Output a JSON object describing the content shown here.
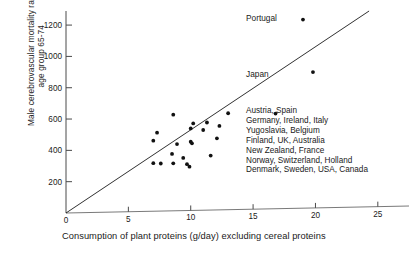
{
  "chart_data": {
    "type": "scatter",
    "title": "",
    "xlabel": "Consumption of plant proteins (g/day) excluding cereal proteins",
    "ylabel_lines": [
      "Male cerebrovascular mortality rates,",
      "age group 65-74"
    ],
    "xlim": [
      0,
      27.5
    ],
    "ylim": [
      0,
      1290
    ],
    "xticks": [
      0,
      5,
      10,
      15,
      20,
      25
    ],
    "yticks": [
      200,
      400,
      600,
      800,
      1000,
      1200
    ],
    "grid": false,
    "legend": "none",
    "points": [
      {
        "x": 19.0,
        "y": 1235
      },
      {
        "x": 19.8,
        "y": 900
      },
      {
        "x": 16.8,
        "y": 635
      },
      {
        "x": 13.0,
        "y": 637
      },
      {
        "x": 8.6,
        "y": 628
      },
      {
        "x": 11.3,
        "y": 578
      },
      {
        "x": 10.2,
        "y": 572
      },
      {
        "x": 12.3,
        "y": 556
      },
      {
        "x": 10.0,
        "y": 540
      },
      {
        "x": 11.0,
        "y": 530
      },
      {
        "x": 7.3,
        "y": 513
      },
      {
        "x": 12.1,
        "y": 477
      },
      {
        "x": 7.0,
        "y": 462
      },
      {
        "x": 10.0,
        "y": 455
      },
      {
        "x": 10.1,
        "y": 445
      },
      {
        "x": 8.9,
        "y": 440
      },
      {
        "x": 8.5,
        "y": 377
      },
      {
        "x": 11.6,
        "y": 367
      },
      {
        "x": 9.4,
        "y": 352
      },
      {
        "x": 7.0,
        "y": 318
      },
      {
        "x": 7.6,
        "y": 316
      },
      {
        "x": 8.6,
        "y": 317
      },
      {
        "x": 9.7,
        "y": 312
      },
      {
        "x": 9.9,
        "y": 296
      }
    ],
    "trendline": {
      "x0": 0,
      "y0": 0,
      "x1": 24.3,
      "y1": 1290
    },
    "annotations": [
      {
        "name": "portugal",
        "text": "Portugal"
      },
      {
        "name": "japan",
        "text": "Japan"
      }
    ],
    "country_list": [
      "Austria, Spain",
      "Germany, Ireland, Italy",
      "Yugoslavia, Belgium",
      "Finland, UK, Australia",
      "New Zealand, France",
      "Norway, Switzerland, Holland",
      "Denmark, Sweden, USA, Canada"
    ]
  },
  "colors": {
    "ink": "#1a1a1a",
    "axis": "#4a4a4a",
    "marker": "#111111",
    "background": "#ffffff"
  }
}
